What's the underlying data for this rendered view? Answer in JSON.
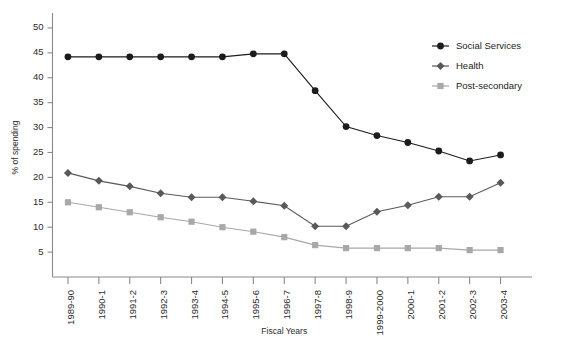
{
  "chart_data": {
    "type": "line",
    "title": "",
    "xlabel": "Fiscal Years",
    "ylabel": "% of spending",
    "categories": [
      "1989-90",
      "1990-1",
      "1991-2",
      "1992-3",
      "1993-4",
      "1994-5",
      "1995-6",
      "1996-7",
      "1997-8",
      "1998-9",
      "1999-2000",
      "2000-1",
      "2001-2",
      "2002-3",
      "2003-4"
    ],
    "ylim": [
      0,
      52
    ],
    "yticks": [
      5,
      10,
      15,
      20,
      25,
      30,
      35,
      40,
      45,
      50
    ],
    "grid": false,
    "legend_position": "top-right",
    "series": [
      {
        "name": "Social Services",
        "marker": "circle",
        "color": "#1c1c1c",
        "values": [
          44.2,
          44.2,
          44.2,
          44.2,
          44.2,
          44.2,
          44.8,
          44.8,
          37.4,
          30.2,
          28.4,
          27.0,
          25.3,
          23.3,
          24.5
        ]
      },
      {
        "name": "Health",
        "marker": "diamond",
        "color": "#595959",
        "values": [
          20.9,
          19.3,
          18.2,
          16.8,
          16.0,
          16.0,
          15.2,
          14.3,
          10.2,
          10.2,
          13.1,
          14.4,
          16.1,
          16.1,
          18.9
        ]
      },
      {
        "name": "Post-secondary",
        "marker": "square",
        "color": "#a8a8a8",
        "values": [
          15.0,
          14.0,
          13.0,
          12.0,
          11.1,
          10.0,
          9.1,
          8.0,
          6.4,
          5.8,
          5.8,
          5.8,
          5.8,
          5.4,
          5.4
        ]
      }
    ]
  },
  "legend": {
    "items": [
      {
        "label": "Social Services"
      },
      {
        "label": "Health"
      },
      {
        "label": "Post-secondary"
      }
    ]
  }
}
